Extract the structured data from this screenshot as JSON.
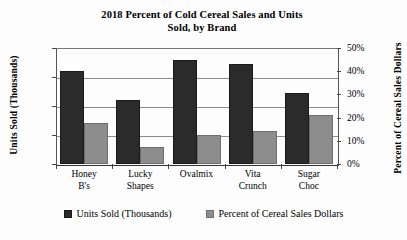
{
  "chart_data": {
    "type": "bar",
    "title": "2018 Percent of Cold Cereal Sales and Units Sold, by Brand",
    "title_line1": "2018 Percent of Cold Cereal Sales and Units",
    "title_line2": "Sold, by Brand",
    "xlabel": "",
    "categories": [
      "Honey B's",
      "Lucky Shapes",
      "Ovalmix",
      "Vita Crunch",
      "Sugar Choc"
    ],
    "category_lines": [
      {
        "l1": "Honey",
        "l2": "B's"
      },
      {
        "l1": "Lucky",
        "l2": "Shapes"
      },
      {
        "l1": "Ovalmix",
        "l2": ""
      },
      {
        "l1": "Vita",
        "l2": "Crunch"
      },
      {
        "l1": "Sugar",
        "l2": "Choc"
      }
    ],
    "series": [
      {
        "name": "Units Sold (Thousands)",
        "axis": "left",
        "color": "#2b2b2b",
        "values": [
          16,
          11,
          18,
          17.2,
          12.2
        ]
      },
      {
        "name": "Percent of Cereal Sales Dollars",
        "axis": "right",
        "color": "#8d8d8d",
        "values": [
          17.7,
          7.3,
          12.6,
          14.3,
          21.2
        ]
      }
    ],
    "left_axis": {
      "label": "Units Sold (Thousands)",
      "ticks": [
        "20",
        "15",
        "10",
        "5",
        "0"
      ],
      "tick_values": [
        20,
        15,
        10,
        5,
        0
      ],
      "ylim": [
        0,
        20
      ]
    },
    "right_axis": {
      "label": "Percent of Cereal Sales Dollars",
      "ticks": [
        "50%",
        "40%",
        "30%",
        "20%",
        "10%",
        "0%"
      ],
      "tick_values": [
        50,
        40,
        30,
        20,
        10,
        0
      ],
      "ylim": [
        0,
        50
      ]
    },
    "grid": true,
    "legend_position": "bottom",
    "legend": [
      {
        "label": "Units Sold (Thousands)",
        "color": "#2b2b2b"
      },
      {
        "label": "Percent of Cereal Sales Dollars",
        "color": "#8d8d8d"
      }
    ]
  }
}
